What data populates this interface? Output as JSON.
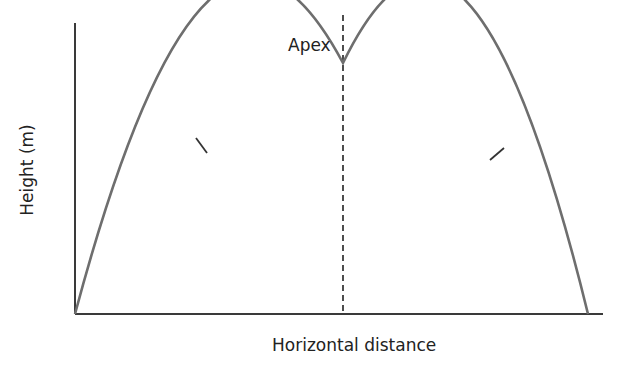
{
  "diagram": {
    "y_axis_label": "Height (m)",
    "x_axis_label": "Horizontal distance",
    "apex_label": "Apex",
    "colors": {
      "axis": "#3a3a3a",
      "curve": "#6e6e6e",
      "dashed_line": "#222222",
      "text": "#222222"
    }
  }
}
